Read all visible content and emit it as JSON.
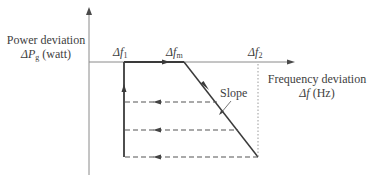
{
  "yaxis": {
    "label_line1": "Power deviation",
    "label_line2_symbol": "ΔP",
    "label_line2_sub": "g",
    "label_line2_unit": " (watt)"
  },
  "xaxis": {
    "label_line1": "Frequency deviation",
    "label_line2_symbol": "Δf",
    "label_line2_unit": " (Hz)"
  },
  "markers": [
    {
      "symbol": "Δf",
      "sub": "1"
    },
    {
      "symbol": "Δf",
      "sub": "m"
    },
    {
      "symbol": "Δf",
      "sub": "2"
    }
  ],
  "annotation": {
    "slope_label": "Slope"
  },
  "colors": {
    "line": "#3a3a3a",
    "axis": "#8a8a8a",
    "dashed": "#555555",
    "dotted": "#9a9a9a"
  }
}
